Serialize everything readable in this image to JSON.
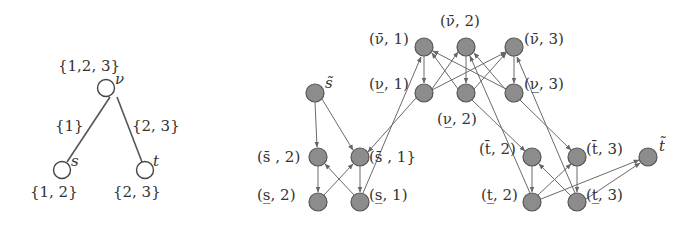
{
  "left_tree": {
    "nodes": {
      "v": {
        "name": "v",
        "label": "ν",
        "set": "{1,2, 3}"
      },
      "s": {
        "name": "s",
        "label": "s",
        "set": "{1, 2}"
      },
      "t": {
        "name": "t",
        "label": "t",
        "set": "{2, 3}"
      }
    },
    "edges": {
      "vs": {
        "label": "{1}"
      },
      "vt": {
        "label": "{2, 3}"
      }
    }
  },
  "right_graph": {
    "nodes": {
      "s_tilde": "s̃",
      "s_bar_2": "(s̄ , 2)",
      "s_bar_1": "(s̄ , 1}",
      "s_under_2": "(s̲, 2)",
      "s_under_1": "(s̲, 1)",
      "v_bar_1": "(ν̄, 1)",
      "v_bar_2": "(ν̄, 2)",
      "v_bar_3": "(ν̄, 3)",
      "v_under_1": "(ν̲, 1)",
      "v_under_2": "(ν̲, 2)",
      "v_under_3": "(ν̲, 3)",
      "t_bar_2": "(t̄, 2)",
      "t_bar_3": "(t̄, 3)",
      "t_tilde": "t̃",
      "t_under_2": "(t̲, 2)",
      "t_under_3": "(t̲, 3)"
    }
  },
  "colors": {
    "node_fill": "#8c8c8c",
    "node_stroke": "#555555",
    "edge": "#6a6a6a",
    "text": "#333333"
  }
}
